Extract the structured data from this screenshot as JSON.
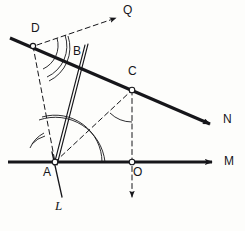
{
  "figure": {
    "background_color": "#fdfdfb",
    "ink_color": "#16161a",
    "points": [
      {
        "id": "A",
        "label": "A",
        "x": 55,
        "y": 162,
        "label_x": 44,
        "label_y": 166,
        "marker": "open-circle"
      },
      {
        "id": "B",
        "label": "B",
        "x": 70,
        "y": 62,
        "label_x": 73,
        "label_y": 50,
        "marker": "none"
      },
      {
        "id": "C",
        "label": "C",
        "x": 132,
        "y": 90,
        "label_x": 131,
        "label_y": 70,
        "marker": "open-circle"
      },
      {
        "id": "D",
        "label": "D",
        "x": 33,
        "y": 46,
        "label_x": 31,
        "label_y": 28,
        "marker": "open-circle"
      },
      {
        "id": "O",
        "label": "O",
        "x": 132,
        "y": 162,
        "label_x": 133,
        "label_y": 166,
        "marker": "open-circle"
      }
    ],
    "ray_labels": [
      {
        "id": "M",
        "label": "M",
        "label_x": 225,
        "label_y": 166,
        "style": "upright"
      },
      {
        "id": "N",
        "label": "N",
        "label_x": 224,
        "label_y": 120,
        "style": "upright"
      },
      {
        "id": "Q",
        "label": "Q",
        "label_x": 124,
        "label_y": 7,
        "style": "upright"
      },
      {
        "id": "L",
        "label": "L",
        "label_x": 55,
        "label_y": 205,
        "style": "italic"
      }
    ],
    "lines": [
      {
        "name": "ray-M-horizontal",
        "kind": "solid-thick",
        "from": [
          8,
          162
        ],
        "to": [
          218,
          162
        ],
        "arrow": true
      },
      {
        "name": "ray-N-through-D-C",
        "kind": "solid-thick",
        "from": [
          10,
          38
        ],
        "to": [
          216,
          127
        ],
        "arrow": true
      },
      {
        "name": "ray-L-through-A",
        "kind": "solid-thin",
        "from": [
          51,
          150
        ],
        "to": [
          62,
          198
        ],
        "arrow": false
      },
      {
        "name": "line-A-to-B-extended",
        "kind": "solid-thin",
        "from": [
          55,
          162
        ],
        "to": [
          88,
          44
        ],
        "arrow": false
      },
      {
        "name": "line-A-to-B-second",
        "kind": "solid-thin",
        "from": [
          57,
          162
        ],
        "to": [
          86,
          44
        ],
        "arrow": false
      },
      {
        "name": "dashed-D-to-A",
        "kind": "dashed-thin",
        "from": [
          33,
          46
        ],
        "to": [
          55,
          162
        ],
        "arrow": false
      },
      {
        "name": "dashed-D-to-Q",
        "kind": "dashed-thin",
        "from": [
          36,
          45
        ],
        "to": [
          118,
          17
        ],
        "arrow": true
      },
      {
        "name": "dashed-A-to-C",
        "kind": "dashed-thin",
        "from": [
          55,
          162
        ],
        "to": [
          132,
          90
        ],
        "arrow": false
      },
      {
        "name": "dashed-C-to-O-down",
        "kind": "dashed-thin",
        "from": [
          132,
          90
        ],
        "to": [
          132,
          200
        ],
        "arrow": true
      }
    ],
    "angle_arcs": [
      {
        "name": "arc-at-D-outer",
        "center": "D",
        "radius": 34,
        "double": true
      },
      {
        "name": "arc-at-D-inner",
        "center": "D",
        "radius": 26,
        "double": false
      },
      {
        "name": "arc-at-A-large",
        "center": "A",
        "radius": 47,
        "double": true
      },
      {
        "name": "arc-at-A-small",
        "center": "A",
        "radius": 28,
        "double": true
      },
      {
        "name": "arc-at-C",
        "center": "C",
        "radius": 32,
        "double": false
      }
    ]
  }
}
